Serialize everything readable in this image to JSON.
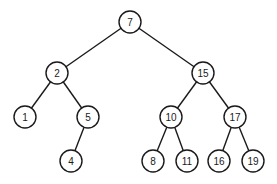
{
  "diagram": {
    "type": "binary-search-tree",
    "node_radius": 11,
    "colors": {
      "stroke": "#1a1a1a",
      "fill": "#ffffff",
      "background": "#ffffff"
    },
    "nodes": [
      {
        "id": "n7",
        "label": "7",
        "x": 130,
        "y": 22
      },
      {
        "id": "n2",
        "label": "2",
        "x": 57,
        "y": 73
      },
      {
        "id": "n15",
        "label": "15",
        "x": 203,
        "y": 73
      },
      {
        "id": "n1",
        "label": "1",
        "x": 25,
        "y": 117
      },
      {
        "id": "n5",
        "label": "5",
        "x": 88,
        "y": 117
      },
      {
        "id": "n10",
        "label": "10",
        "x": 171,
        "y": 117
      },
      {
        "id": "n17",
        "label": "17",
        "x": 235,
        "y": 117
      },
      {
        "id": "n4",
        "label": "4",
        "x": 71,
        "y": 161
      },
      {
        "id": "n8",
        "label": "8",
        "x": 153,
        "y": 161
      },
      {
        "id": "n11",
        "label": "11",
        "x": 187,
        "y": 161
      },
      {
        "id": "n16",
        "label": "16",
        "x": 219,
        "y": 161
      },
      {
        "id": "n19",
        "label": "19",
        "x": 253,
        "y": 161
      }
    ],
    "edges": [
      {
        "from": "n7",
        "to": "n2"
      },
      {
        "from": "n7",
        "to": "n15"
      },
      {
        "from": "n2",
        "to": "n1"
      },
      {
        "from": "n2",
        "to": "n5"
      },
      {
        "from": "n5",
        "to": "n4"
      },
      {
        "from": "n15",
        "to": "n10"
      },
      {
        "from": "n15",
        "to": "n17"
      },
      {
        "from": "n10",
        "to": "n8"
      },
      {
        "from": "n10",
        "to": "n11"
      },
      {
        "from": "n17",
        "to": "n16"
      },
      {
        "from": "n17",
        "to": "n19"
      }
    ]
  }
}
